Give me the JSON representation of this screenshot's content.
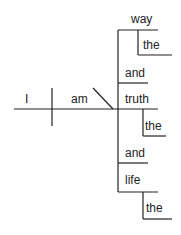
{
  "diagram": {
    "type": "sentence-diagram",
    "subject": "I",
    "verb": "am",
    "complements": [
      {
        "word": "way",
        "modifier": "the"
      },
      {
        "conjunction": "and"
      },
      {
        "word": "truth",
        "modifier": "the"
      },
      {
        "conjunction": "and"
      },
      {
        "word": "life",
        "modifier": "the"
      }
    ],
    "words": {
      "subject": "I",
      "verb": "am",
      "way": "way",
      "the1": "the",
      "and1": "and",
      "truth": "truth",
      "the2": "the",
      "and2": "and",
      "life": "life",
      "the3": "the"
    },
    "line_color": "#222222"
  }
}
